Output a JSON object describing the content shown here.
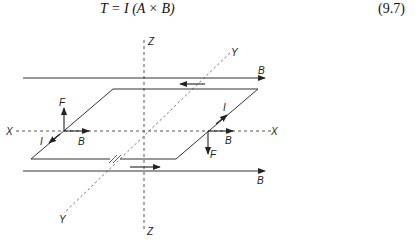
{
  "equation": {
    "text": "T = I (A × B)",
    "number": "(9.7)"
  },
  "diagram": {
    "axes": {
      "x_left_label": "X",
      "x_right_label": "X",
      "y_top_label": "Y",
      "y_bottom_label": "Y",
      "z_top_label": "Z",
      "z_bottom_label": "Z"
    },
    "field_lines": {
      "top_label": "B",
      "bottom_label": "B"
    },
    "left_side": {
      "force_label": "F",
      "field_label": "B",
      "current_label": "I"
    },
    "right_side": {
      "force_label": "F",
      "field_label": "B",
      "current_label": "I"
    },
    "colors": {
      "line": "#333333",
      "axis": "#555555",
      "text": "#222222"
    }
  }
}
